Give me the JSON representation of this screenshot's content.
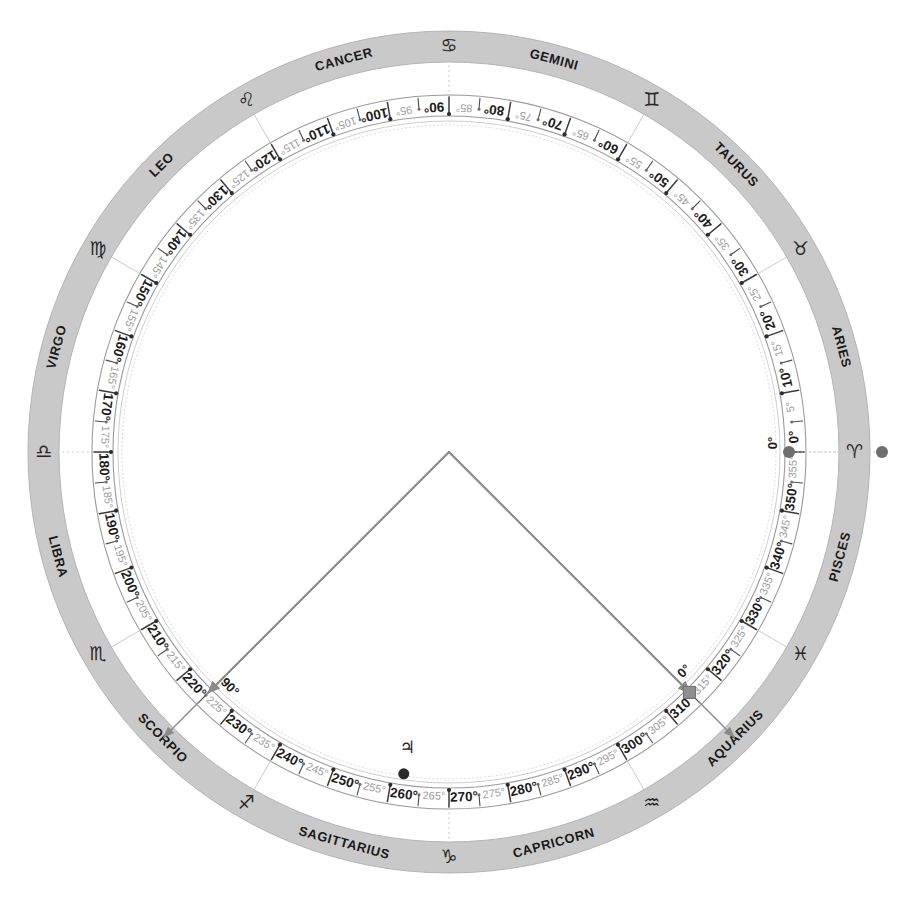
{
  "diagram": {
    "type": "astrological-chart-wheel",
    "center": {
      "x": 449,
      "y": 452
    },
    "geometry": {
      "band_outer_radius": 421,
      "band_inner_radius": 390,
      "tick_ring_outer_radius": 357,
      "tick_ring_inner_radius": 336,
      "inner_thin_radius": 331,
      "inner_dash_radius": 327,
      "zero_degree_screen_angle_deg": 0,
      "direction": "counterclockwise"
    },
    "colors": {
      "band_fill": "#c9c9c9",
      "band_edge": "#b4b4b4",
      "tick_ring_stroke": "#9a9a9a",
      "major_label": "#1c1c1c",
      "minor_label": "#9c9c9c",
      "angle_line": "#8a8a8a",
      "marker_gray": "#6e6e6e",
      "marker_dark": "#2a2a2a",
      "background": "#ffffff"
    }
  },
  "zodiac": {
    "signs": [
      {
        "name": "ARIES",
        "glyph": "♈",
        "start_deg": 0,
        "end_deg": 30
      },
      {
        "name": "TAURUS",
        "glyph": "♉",
        "start_deg": 30,
        "end_deg": 60
      },
      {
        "name": "GEMINI",
        "glyph": "♊",
        "start_deg": 60,
        "end_deg": 90
      },
      {
        "name": "CANCER",
        "glyph": "♋",
        "start_deg": 90,
        "end_deg": 120
      },
      {
        "name": "LEO",
        "glyph": "♌",
        "start_deg": 120,
        "end_deg": 150
      },
      {
        "name": "VIRGO",
        "glyph": "♍",
        "start_deg": 150,
        "end_deg": 180
      },
      {
        "name": "LIBRA",
        "glyph": "♎",
        "start_deg": 180,
        "end_deg": 210
      },
      {
        "name": "SCORPIO",
        "glyph": "♏",
        "start_deg": 210,
        "end_deg": 240
      },
      {
        "name": "SAGITTARIUS",
        "glyph": "♐",
        "start_deg": 240,
        "end_deg": 270
      },
      {
        "name": "CAPRICORN",
        "glyph": "♑",
        "start_deg": 270,
        "end_deg": 300
      },
      {
        "name": "AQUARIUS",
        "glyph": "♒",
        "start_deg": 300,
        "end_deg": 330
      },
      {
        "name": "PISCES",
        "glyph": "♓",
        "start_deg": 330,
        "end_deg": 360
      }
    ]
  },
  "scale": {
    "major_step_deg": 10,
    "minor_step_deg": 5,
    "unit_suffix": "°",
    "major_labels": [
      "0°",
      "10°",
      "20°",
      "30°",
      "40°",
      "50°",
      "60°",
      "70°",
      "80°",
      "90°",
      "100°",
      "110°",
      "120°",
      "130°",
      "140°",
      "150°",
      "160°",
      "170°",
      "180°",
      "190°",
      "200°",
      "210°",
      "220°",
      "230°",
      "240°",
      "250°",
      "260°",
      "270°",
      "280°",
      "290°",
      "300°",
      "310°",
      "320°",
      "330°",
      "340°",
      "350°"
    ],
    "minor_labels": [
      "5°",
      "15°",
      "25°",
      "35°",
      "45°",
      "55°",
      "65°",
      "75°",
      "85°",
      "95°",
      "105°",
      "115°",
      "125°",
      "135°",
      "145°",
      "155°",
      "165°",
      "175°",
      "185°",
      "195°",
      "205°",
      "215°",
      "225°",
      "235°",
      "245°",
      "255°",
      "265°",
      "275°",
      "285°",
      "295°",
      "305°",
      "315°",
      "325°",
      "335°",
      "345°",
      "355°"
    ]
  },
  "markers": [
    {
      "id": "origin-point",
      "deg": 0,
      "shape": "dot",
      "label": "0°",
      "ring": "tick-inner"
    },
    {
      "id": "aries-ref-dot",
      "deg": 0,
      "shape": "dot",
      "label": "",
      "ring": "outside-band"
    },
    {
      "id": "angle-start",
      "deg": 315,
      "shape": "square",
      "label": "0°",
      "ring": "tick-inner"
    },
    {
      "id": "angle-end",
      "deg": 225,
      "shape": "arrow",
      "label": "90°",
      "ring": "tick-inner"
    },
    {
      "id": "jupiter-point",
      "deg": 262,
      "shape": "dot",
      "label": "♃",
      "ring": "inner"
    }
  ],
  "angle_rays": [
    {
      "id": "ray-to-315",
      "from_deg": 315,
      "value_label": "0°",
      "target_sign": "AQUARIUS"
    },
    {
      "id": "ray-to-225",
      "from_deg": 225,
      "value_label": "90°",
      "target_sign": "SCORPIO"
    }
  ],
  "planets": [
    {
      "name": "Jupiter",
      "glyph": "♃",
      "deg": 262
    }
  ]
}
